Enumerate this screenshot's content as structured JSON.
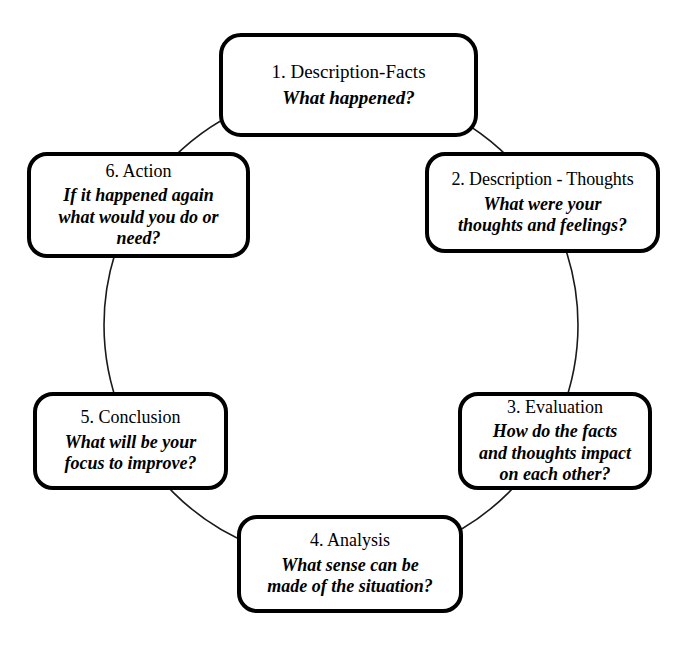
{
  "diagram": {
    "name": "gibbs-reflective-cycle",
    "shape": "cycle",
    "background_color": "#ffffff",
    "line_color": "#000000",
    "nodes": [
      {
        "id": "node-1",
        "position": "top",
        "title": "1. Description-Facts",
        "question": "What happened?",
        "question_lines": [
          "What happened?"
        ]
      },
      {
        "id": "node-2",
        "position": "upper-right",
        "title": "2. Description - Thoughts",
        "question": "What were your thoughts and feelings?",
        "question_lines": [
          "What were your",
          "thoughts and feelings?"
        ]
      },
      {
        "id": "node-3",
        "position": "lower-right",
        "title": "3. Evaluation",
        "question": "How do the facts and thoughts impact on each other?",
        "question_lines": [
          "How do the facts",
          "and thoughts impact",
          "on each other?"
        ]
      },
      {
        "id": "node-4",
        "position": "bottom",
        "title": "4. Analysis",
        "question": "What sense can be made of the situation?",
        "question_lines": [
          "What sense can be",
          "made of the situation?"
        ]
      },
      {
        "id": "node-5",
        "position": "lower-left",
        "title": "5. Conclusion",
        "question": "What will be your focus to improve?",
        "question_lines": [
          "What will be your",
          "focus to improve?"
        ]
      },
      {
        "id": "node-6",
        "position": "upper-left",
        "title": "6. Action",
        "question": "If it happened again what would you do or need?",
        "question_lines": [
          "If it happened again",
          "what would you do or",
          "need?"
        ]
      }
    ]
  }
}
